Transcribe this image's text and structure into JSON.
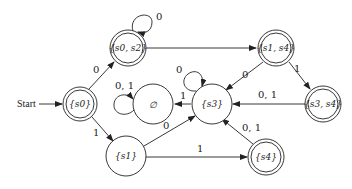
{
  "diagram": {
    "type": "DFA state diagram",
    "start_label": "Start",
    "states": [
      {
        "id": "s0",
        "label": "{s0}",
        "final": true
      },
      {
        "id": "s0s2",
        "label": "{s0, s2}",
        "final": true
      },
      {
        "id": "s1s4",
        "label": "{s1, s4}",
        "final": true
      },
      {
        "id": "empty",
        "label": "∅",
        "final": false
      },
      {
        "id": "s3",
        "label": "{s3}",
        "final": false
      },
      {
        "id": "s3s4",
        "label": "{s3, s4}",
        "final": true
      },
      {
        "id": "s1",
        "label": "{s1}",
        "final": false
      },
      {
        "id": "s4",
        "label": "{s4}",
        "final": true
      }
    ],
    "transitions": [
      {
        "from": "s0",
        "to": "s0s2",
        "label": "0"
      },
      {
        "from": "s0",
        "to": "s1",
        "label": "1"
      },
      {
        "from": "s0s2",
        "to": "s0s2",
        "label": "0"
      },
      {
        "from": "s0s2",
        "to": "s1s4",
        "label": ""
      },
      {
        "from": "s1s4",
        "to": "s3",
        "label": "0"
      },
      {
        "from": "s1s4",
        "to": "s3s4",
        "label": "1"
      },
      {
        "from": "s3s4",
        "to": "s3",
        "label": "0, 1"
      },
      {
        "from": "s3",
        "to": "s3",
        "label": "0"
      },
      {
        "from": "s3",
        "to": "empty",
        "label": "1"
      },
      {
        "from": "empty",
        "to": "empty",
        "label": "0, 1"
      },
      {
        "from": "s1",
        "to": "s3",
        "label": "0"
      },
      {
        "from": "s1",
        "to": "s4",
        "label": "1"
      },
      {
        "from": "s4",
        "to": "s3",
        "label": "0, 1"
      }
    ]
  }
}
